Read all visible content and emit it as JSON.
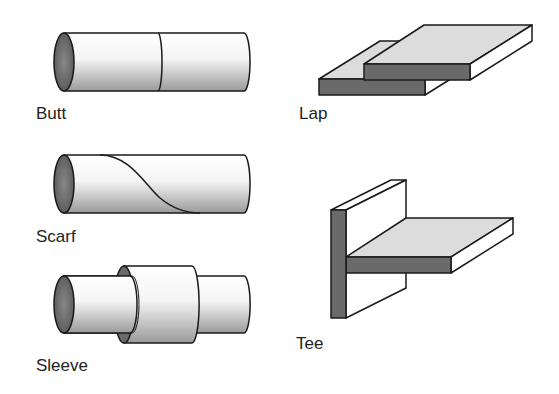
{
  "joints": [
    {
      "id": "butt",
      "label": "Butt"
    },
    {
      "id": "lap",
      "label": "Lap"
    },
    {
      "id": "scarf",
      "label": "Scarf"
    },
    {
      "id": "tee",
      "label": "Tee"
    },
    {
      "id": "sleeve",
      "label": "Sleeve"
    }
  ],
  "colors": {
    "outline": "#1a1a1a",
    "end_face": "#6e6e6e",
    "top_surface": "#dcdcdc",
    "side_face": "#ffffff",
    "cross_section": "#6a6a6a"
  }
}
